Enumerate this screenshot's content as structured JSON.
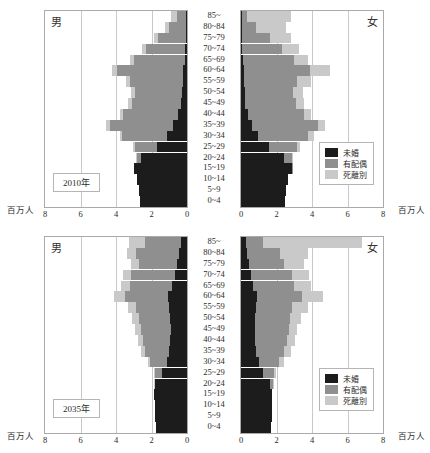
{
  "colors": {
    "unmarried": "#1c1c1c",
    "married": "#8f8f8f",
    "widowed_divorced": "#c9c9c9",
    "frame": "#aaaaaa",
    "grid": "#c9c9c9"
  },
  "labels": {
    "male": "男",
    "female": "女",
    "unit": "百万人",
    "legend": {
      "unmarried": "未婚",
      "married": "有配偶",
      "widowed_divorced": "死離別"
    }
  },
  "age_groups": [
    "85~",
    "80~84",
    "75~79",
    "70~74",
    "65~69",
    "60~64",
    "55~59",
    "50~54",
    "45~49",
    "40~44",
    "35~39",
    "30~34",
    "25~29",
    "20~24",
    "15~19",
    "10~14",
    "5~9",
    "0~4"
  ],
  "x_ticks_male": [
    "8",
    "6",
    "4",
    "2",
    "0"
  ],
  "x_ticks_female": [
    "0",
    "2",
    "4",
    "6",
    "8"
  ],
  "chart_data": [
    {
      "type": "bar",
      "title": "2010年",
      "subtitle": "",
      "xlabel": "百万人",
      "ylabel": "",
      "xlim": [
        0,
        8
      ],
      "grid": true,
      "legend_position": "bottom-right (female panel)",
      "orientation": "horizontal population pyramid",
      "categories": [
        "85~",
        "80~84",
        "75~79",
        "70~74",
        "65~69",
        "60~64",
        "55~59",
        "50~54",
        "45~49",
        "40~44",
        "35~39",
        "30~34",
        "25~29",
        "20~24",
        "15~19",
        "10~14",
        "5~9",
        "0~4"
      ],
      "panels": [
        {
          "name": "男",
          "direction": "left",
          "series": [
            {
              "name": "未婚",
              "values": [
                0.03,
                0.05,
                0.07,
                0.1,
                0.14,
                0.22,
                0.25,
                0.28,
                0.33,
                0.5,
                0.8,
                1.1,
                1.7,
                2.6,
                3.0,
                2.8,
                2.7,
                2.65
              ]
            },
            {
              "name": "有配偶",
              "values": [
                0.55,
                0.95,
                1.55,
                2.2,
                2.85,
                3.7,
                2.95,
                2.65,
                2.75,
                3.1,
                3.55,
                2.55,
                1.25,
                0.25,
                0.0,
                0.0,
                0.0,
                0.0
              ]
            },
            {
              "name": "死離別",
              "values": [
                0.3,
                0.25,
                0.22,
                0.22,
                0.22,
                0.28,
                0.25,
                0.25,
                0.22,
                0.2,
                0.2,
                0.15,
                0.08,
                0.02,
                0.0,
                0.0,
                0.0,
                0.0
              ]
            }
          ]
        },
        {
          "name": "女",
          "direction": "right",
          "series": [
            {
              "name": "未婚",
              "values": [
                0.04,
                0.05,
                0.06,
                0.08,
                0.11,
                0.15,
                0.17,
                0.2,
                0.25,
                0.37,
                0.6,
                0.95,
                1.55,
                2.45,
                2.85,
                2.65,
                2.55,
                2.5
              ]
            },
            {
              "name": "有配偶",
              "values": [
                0.3,
                0.8,
                1.55,
                2.25,
                2.9,
                3.75,
                3.0,
                2.75,
                2.85,
                3.2,
                3.75,
                2.85,
                1.6,
                0.4,
                0.02,
                0.0,
                0.0,
                0.0
              ]
            },
            {
              "name": "死離別",
              "values": [
                2.45,
                1.7,
                1.2,
                0.95,
                0.75,
                1.1,
                0.75,
                0.55,
                0.45,
                0.4,
                0.4,
                0.3,
                0.15,
                0.03,
                0.0,
                0.0,
                0.0,
                0.0
              ]
            }
          ]
        }
      ]
    },
    {
      "type": "bar",
      "title": "2035年",
      "subtitle": "",
      "xlabel": "百万人",
      "ylabel": "",
      "xlim": [
        0,
        8
      ],
      "grid": true,
      "legend_position": "bottom-right (female panel)",
      "orientation": "horizontal population pyramid",
      "categories": [
        "85~",
        "80~84",
        "75~79",
        "70~74",
        "65~69",
        "60~64",
        "55~59",
        "50~54",
        "45~49",
        "40~44",
        "35~39",
        "30~34",
        "25~29",
        "20~24",
        "15~19",
        "10~14",
        "5~9",
        "0~4"
      ],
      "panels": [
        {
          "name": "男",
          "direction": "left",
          "series": [
            {
              "name": "未婚",
              "values": [
                0.35,
                0.45,
                0.55,
                0.7,
                0.85,
                1.05,
                1.0,
                0.95,
                0.9,
                0.95,
                1.0,
                1.15,
                1.4,
                1.8,
                1.85,
                1.8,
                1.8,
                1.75
              ]
            },
            {
              "name": "有配偶",
              "values": [
                2.0,
                2.4,
                2.15,
                2.45,
                2.35,
                2.45,
                1.85,
                1.75,
                1.7,
                1.55,
                1.35,
                0.95,
                0.4,
                0.05,
                0.0,
                0.0,
                0.0,
                0.0
              ]
            },
            {
              "name": "死離別",
              "values": [
                0.9,
                0.55,
                0.45,
                0.45,
                0.5,
                0.6,
                0.45,
                0.4,
                0.35,
                0.28,
                0.22,
                0.12,
                0.05,
                0.01,
                0.0,
                0.0,
                0.0,
                0.0
              ]
            }
          ]
        },
        {
          "name": "女",
          "direction": "right",
          "series": [
            {
              "name": "未婚",
              "values": [
                0.3,
                0.35,
                0.45,
                0.55,
                0.7,
                0.9,
                0.85,
                0.8,
                0.78,
                0.8,
                0.85,
                1.0,
                1.25,
                1.65,
                1.75,
                1.72,
                1.72,
                1.7
              ]
            },
            {
              "name": "有配偶",
              "values": [
                0.95,
                1.85,
                1.95,
                2.3,
                2.3,
                2.55,
                2.05,
                1.95,
                1.9,
                1.8,
                1.6,
                1.15,
                0.6,
                0.15,
                0.0,
                0.0,
                0.0,
                0.0
              ]
            },
            {
              "name": "死離別",
              "values": [
                5.55,
                1.55,
                1.15,
                1.0,
                0.95,
                1.15,
                0.85,
                0.65,
                0.5,
                0.45,
                0.38,
                0.25,
                0.12,
                0.03,
                0.0,
                0.0,
                0.0,
                0.0
              ]
            }
          ]
        }
      ]
    }
  ]
}
